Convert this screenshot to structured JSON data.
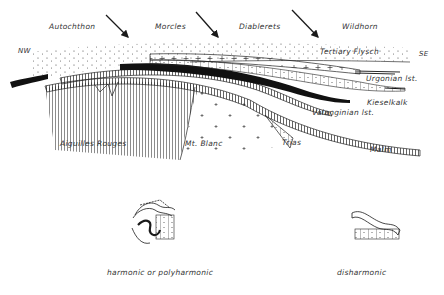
{
  "diagram": {
    "type": "geological-cross-section",
    "top_labels": [
      {
        "id": "autochthon",
        "text": "Autochthon"
      },
      {
        "id": "morcles",
        "text": "Morcles"
      },
      {
        "id": "diablerets",
        "text": "Diablerets"
      },
      {
        "id": "wildhorn",
        "text": "Wildhorn"
      }
    ],
    "orientation": {
      "left": "NW",
      "right": "SE"
    },
    "layer_labels": {
      "flysch": "Tertiary  Flysch",
      "urgonian": "Urgonian  lst.",
      "kieselkalk": "Kieselkalk",
      "valanginian": "Valanginian  lst.",
      "malm": "Malm",
      "trias": "Trias"
    },
    "basement_labels": {
      "aiguilles_rouges": "Aiguilles  Rouges",
      "mt_blanc": "Mt. Blanc"
    },
    "fold_styles": [
      {
        "id": "harmonic",
        "label": "harmonic  or  polyharmonic"
      },
      {
        "id": "disharmonic",
        "label": "disharmonic"
      }
    ],
    "colors": {
      "ink": "#1a1a1a",
      "background": "#ffffff"
    }
  }
}
